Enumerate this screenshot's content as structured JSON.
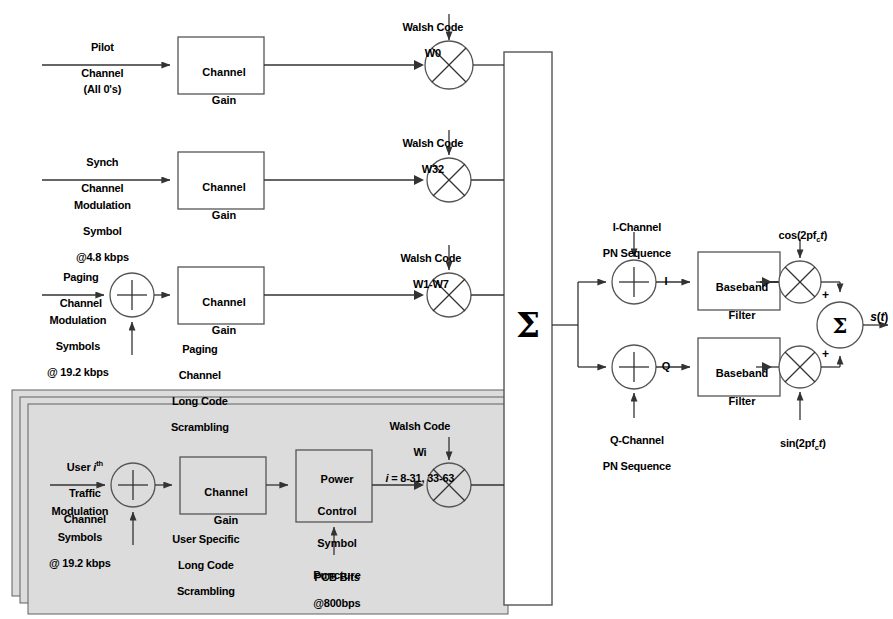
{
  "colors": {
    "line": "#333333",
    "panel_fill": "#dcdcdc",
    "panel_stroke": "#555555",
    "box_fill": "#ffffff",
    "text": "#000000"
  },
  "channels": {
    "pilot": {
      "name_line1": "Pilot",
      "name_line2": "Channel",
      "detail": "(All 0's)",
      "gain_label_line1": "Channel",
      "gain_label_line2": "Gain",
      "walsh_line1": "Walsh Code",
      "walsh_line2": "W0"
    },
    "synch": {
      "name_line1": "Synch",
      "name_line2": "Channel",
      "detail_line1": "Modulation",
      "detail_line2": "Symbol",
      "detail_line3": "@4.8 kbps",
      "gain_label_line1": "Channel",
      "gain_label_line2": "Gain",
      "walsh_line1": "Walsh Code",
      "walsh_line2": "W32"
    },
    "paging": {
      "name_line1": "Paging",
      "name_line2": "Channel",
      "detail_line1": "Modulation",
      "detail_line2": "Symbols",
      "detail_line3": "@ 19.2 kbps",
      "scramble_line1": "Paging",
      "scramble_line2": "Channel",
      "scramble_line3": "Long Code",
      "scramble_line4": "Scrambling",
      "gain_label_line1": "Channel",
      "gain_label_line2": "Gain",
      "walsh_line1": "Walsh Code",
      "walsh_line2": "W1-W7"
    },
    "traffic": {
      "name_prefix": "User ",
      "name_i": "i",
      "name_sup": "th",
      "name_line2": "Traffic",
      "name_line3": "Channel",
      "detail_line1": "Modulation",
      "detail_line2": "Symbols",
      "detail_line3": "@ 19.2 kbps",
      "scramble_line1": "User Specific",
      "scramble_line2": "Long Code",
      "scramble_line3": "Scrambling",
      "gain_label_line1": "Channel",
      "gain_label_line2": "Gain",
      "pcsp_line1": "Power",
      "pcsp_line2": "Control",
      "pcsp_line3": "Symbol",
      "pcsp_line4": "Puncture",
      "pcb_line1": "PCB Bits",
      "pcb_line2": "@800bps",
      "walsh_line1": "Walsh Code",
      "walsh_line2": "Wi",
      "walsh_line3_i": "i",
      "walsh_line3_rest": " = 8-31, 33-63"
    }
  },
  "summer": {
    "symbol": "Σ"
  },
  "iq": {
    "i_pn_line1": "I-Channel",
    "i_pn_line2": "PN Sequence",
    "q_pn_line1": "Q-Channel",
    "q_pn_line2": "PN Sequence",
    "i_label": "I",
    "q_label": "Q",
    "filter_i_line1": "Baseband",
    "filter_i_line2": "Filter",
    "filter_q_line1": "Baseband",
    "filter_q_line2": "Filter",
    "carrier_cos_pre": "cos(2pf",
    "carrier_cos_sub": "c",
    "carrier_cos_t": "t",
    "carrier_cos_post": ")",
    "carrier_sin_pre": "sin(2pf",
    "carrier_sin_sub": "c",
    "carrier_sin_t": "t",
    "carrier_sin_post": ")",
    "sum_symbol": "Σ",
    "plus_top": "+",
    "plus_bottom": "+",
    "output_s": "s",
    "output_paren_open": "(",
    "output_t": "t",
    "output_paren_close": ")"
  }
}
